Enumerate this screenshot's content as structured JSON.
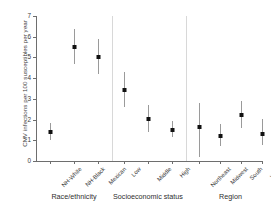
{
  "chart_data": {
    "type": "scatter",
    "title": "",
    "xlabel": "",
    "ylabel": "CMV infections per 100 susceptibles per year",
    "ylim": [
      0,
      7
    ],
    "ytick_labels": [
      "0",
      "1",
      "2",
      "3",
      "4",
      "5",
      "6",
      "7"
    ],
    "ytick_values": [
      0,
      1,
      2,
      3,
      4,
      5,
      6,
      7
    ],
    "grid": false,
    "legend": "none",
    "error_bars": "95% confidence interval",
    "groups": [
      {
        "name": "Race/ethnicity",
        "categories": [
          "NH-White",
          "NH-Black",
          "Mexican"
        ],
        "values": [
          1.42,
          5.52,
          5.02
        ],
        "ci_low": [
          1.02,
          4.7,
          4.2
        ],
        "ci_high": [
          1.82,
          6.38,
          5.88
        ]
      },
      {
        "name": "Socioeconomic status",
        "categories": [
          "Low",
          "Middle",
          "High"
        ],
        "values": [
          3.43,
          2.03,
          1.52
        ],
        "ci_low": [
          2.62,
          1.38,
          1.18
        ],
        "ci_high": [
          4.3,
          2.7,
          1.92
        ]
      },
      {
        "name": "Region",
        "categories": [
          "Northeast",
          "Midwest",
          "South",
          "West"
        ],
        "values": [
          1.62,
          1.23,
          2.22,
          1.32
        ],
        "ci_low": [
          0.18,
          0.72,
          1.6,
          0.78
        ],
        "ci_high": [
          2.8,
          1.8,
          2.9,
          2.02
        ]
      }
    ],
    "colors": {
      "marker": "#111111",
      "error_bar": "#9a9a9a",
      "axis": "#6e6e6e",
      "separator": "#d8d8d8",
      "text": "#3a3a3a",
      "background": "#ffffff"
    }
  }
}
